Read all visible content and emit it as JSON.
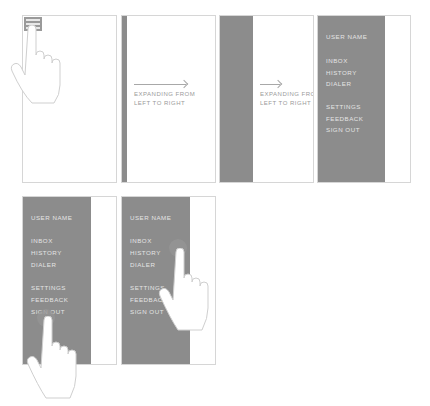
{
  "colors": {
    "panel": "#8c8c8c",
    "frame_border": "#d6d6d6",
    "menu_text": "#e4e4e4",
    "caption_text": "#9a9a9a"
  },
  "frames": [
    {
      "step": 1,
      "description": "tap hamburger menu icon",
      "icon": "hamburger-icon",
      "gesture": "hand-pointer"
    },
    {
      "step": 2,
      "caption_line1": "EXPANDING FROM",
      "caption_line2": "LEFT TO RIGHT",
      "arrow": "arrow-right"
    },
    {
      "step": 3,
      "caption_line1": "EXPANDING FROM",
      "caption_line2": "LEFT TO RIGHT",
      "arrow": "arrow-right"
    },
    {
      "step": 4,
      "menu": "open"
    },
    {
      "step": 5,
      "menu": "open",
      "tapped_item": "SIGN OUT"
    },
    {
      "step": 6,
      "menu": "open",
      "tapped_item": "HISTORY"
    }
  ],
  "menu": {
    "user_name": "USER NAME",
    "items_primary": [
      "INBOX",
      "HISTORY",
      "DIALER"
    ],
    "items_secondary": [
      "SETTINGS",
      "FEEDBACK",
      "SIGN OUT"
    ]
  }
}
